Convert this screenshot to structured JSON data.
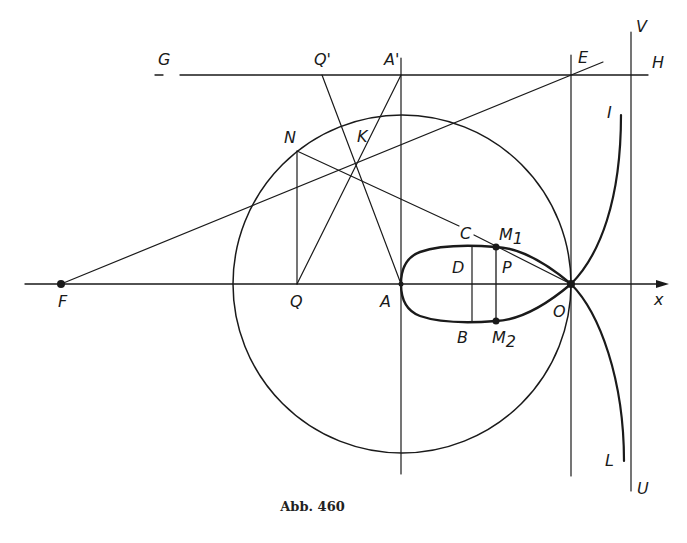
{
  "figure": {
    "caption": "Abb. 460",
    "stroke_color": "#1a1a1a",
    "background": "#ffffff"
  },
  "labels": {
    "G": "G",
    "H": "H",
    "Q_prime": "Q'",
    "A_prime": "A'",
    "E": "E",
    "V": "V",
    "N": "N",
    "K": "K",
    "C": "C",
    "M1": "M",
    "M1_sub": "1",
    "D": "D",
    "P": "P",
    "F": "F",
    "Q": "Q",
    "A": "A",
    "B": "B",
    "M2": "M",
    "M2_sub": "2",
    "O": "O",
    "x": "x",
    "I": "I",
    "L": "L",
    "U": "U"
  }
}
